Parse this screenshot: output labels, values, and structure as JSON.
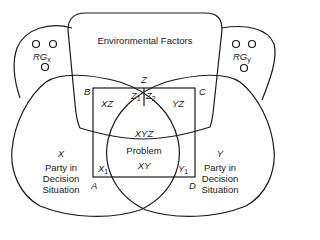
{
  "diagram": {
    "environment": {
      "label": "Environmental Factors"
    },
    "reference_groups": {
      "x": {
        "label": "RG",
        "sub": "x"
      },
      "y": {
        "label": "RG",
        "sub": "y"
      }
    },
    "parties": {
      "x": {
        "letter": "X",
        "line1": "Party in",
        "line2": "Decision",
        "line3": "Situation"
      },
      "y": {
        "letter": "Y",
        "line1": "Party in",
        "line2": "Decision",
        "line3": "Situation"
      }
    },
    "corners": {
      "a": "A",
      "b": "B",
      "c": "C",
      "d": "D"
    },
    "regions": {
      "z": "Z",
      "z1": {
        "label": "Z",
        "sub": "1"
      },
      "z2": {
        "label": "Z",
        "sub": "2"
      },
      "xz": "XZ",
      "yz": "YZ",
      "xyz": "XYZ",
      "problem": "Problem",
      "xy": "XY",
      "x1": {
        "label": "X",
        "sub": "1"
      },
      "y1": {
        "label": "Y",
        "sub": "1"
      }
    },
    "colors": {
      "stroke": "#1a1a1a",
      "background": "#ffffff"
    }
  }
}
